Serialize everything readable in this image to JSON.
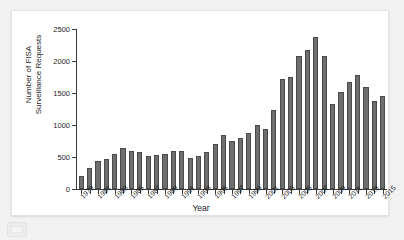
{
  "chart_data": {
    "type": "bar",
    "title": "",
    "xlabel": "Year",
    "ylabel": "Number of FISA Surveillance Requests",
    "ylabel_line1": "Number of FISA",
    "ylabel_line2": "Surveillance Requests",
    "ylim": [
      0,
      2500
    ],
    "yticks": [
      0,
      500,
      1000,
      1500,
      2000,
      2500
    ],
    "ytick_labels": [
      "0",
      "500",
      "1000",
      "1500",
      "2000",
      "2500"
    ],
    "grid": false,
    "legend": "none",
    "bar_color": "#6e6e6e",
    "bar_edge_color": "#4a4a4a",
    "axis_color": "#3a3a3a",
    "categories": [
      "1979",
      "1980",
      "1981",
      "1982",
      "1983",
      "1984",
      "1985",
      "1986",
      "1987",
      "1988",
      "1989",
      "1990",
      "1991",
      "1992",
      "1993",
      "1994",
      "1995",
      "1996",
      "1997",
      "1998",
      "1999",
      "2000",
      "2001",
      "2002",
      "2003",
      "2004",
      "2005",
      "2006",
      "2007",
      "2008",
      "2009",
      "2010",
      "2011",
      "2012",
      "2013",
      "2014",
      "2015"
    ],
    "values": [
      207,
      322,
      433,
      475,
      549,
      635,
      587,
      573,
      512,
      534,
      546,
      598,
      593,
      484,
      511,
      576,
      697,
      839,
      749,
      796,
      880,
      1003,
      932,
      1228,
      1724,
      1758,
      2072,
      2176,
      2370,
      2083,
      1329,
      1511,
      1676,
      1789,
      1588,
      1379,
      1457
    ],
    "xtick_labels_shown": [
      "1979",
      "1981",
      "1983",
      "1985",
      "1987",
      "1989",
      "1991",
      "1993",
      "1995",
      "1997",
      "1999",
      "2001",
      "2003",
      "2005",
      "2007",
      "2009",
      "2011",
      "2013",
      "2015"
    ]
  },
  "page": {
    "background_color": "#f2f2f2",
    "card_background_color": "#ffffff"
  }
}
